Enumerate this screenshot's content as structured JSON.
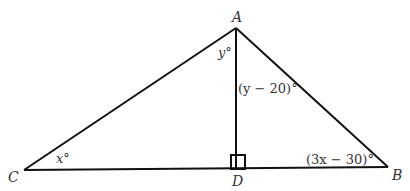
{
  "diagram": {
    "type": "triangle",
    "vertices": {
      "A": {
        "label": "A"
      },
      "B": {
        "label": "B"
      },
      "C": {
        "label": "C"
      },
      "D": {
        "label": "D"
      }
    },
    "angles": {
      "C": "x°",
      "A_left": "y°",
      "A_right": "(y − 20)°",
      "B": "(3x − 30)°"
    },
    "right_angle_at": "D",
    "line_color": "#111111"
  }
}
